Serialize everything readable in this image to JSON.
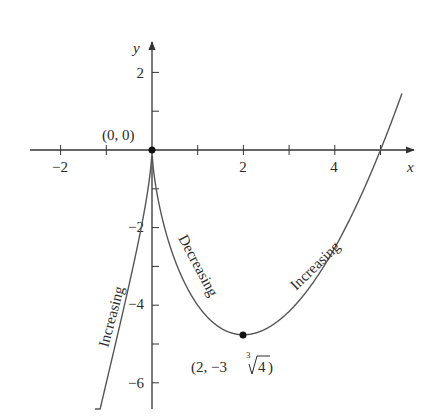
{
  "chart_data": {
    "type": "line",
    "title": "",
    "function": "f(x) = x^(5/3) - 5x^(2/3)",
    "xlabel": "x",
    "ylabel": "y",
    "xlim": [
      -2.0,
      6.3
    ],
    "ylim": [
      -6.8,
      2.9
    ],
    "x_ticks": [
      -2,
      -1,
      0,
      1,
      2,
      3,
      4,
      5
    ],
    "x_tick_labels": [
      {
        "value": -2,
        "label": "−2"
      },
      {
        "value": 2,
        "label": "2"
      },
      {
        "value": 4,
        "label": "4"
      }
    ],
    "y_ticks": [
      2,
      1,
      -1,
      -2,
      -3,
      -4,
      -5,
      -6
    ],
    "y_tick_labels": [
      {
        "value": 2,
        "label": "2"
      },
      {
        "value": -2,
        "label": "−2"
      },
      {
        "value": -4,
        "label": "−4"
      },
      {
        "value": -6,
        "label": "−6"
      }
    ],
    "x_range_plotted": [
      -1.25,
      5.47
    ],
    "points": [
      {
        "x": 0,
        "y": 0,
        "label": "(0, 0)"
      },
      {
        "x": 2,
        "y": -4.762,
        "label": "(2, −3∛4)"
      }
    ],
    "annotations": [
      {
        "text": "Increasing",
        "interval": "x < 0"
      },
      {
        "text": "Decreasing",
        "interval": "0 < x < 2"
      },
      {
        "text": "Increasing",
        "interval": "x > 2"
      }
    ],
    "grid": false,
    "color": "#555555"
  },
  "labels": {
    "x_axis": "x",
    "y_axis": "y",
    "origin_point": "(0, 0)",
    "min_point_prefix": "(2, −3",
    "min_point_root_index": "3",
    "min_point_radicand": "4",
    "min_point_suffix": ")",
    "increasing_left": "Increasing",
    "decreasing": "Decreasing",
    "increasing_right": "Increasing",
    "tick_x_neg2": "−2",
    "tick_x_2": "2",
    "tick_x_4": "4",
    "tick_y_2": "2",
    "tick_y_neg2": "−2",
    "tick_y_neg4": "−4",
    "tick_y_neg6": "−6"
  }
}
